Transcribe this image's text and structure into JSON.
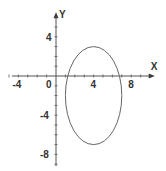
{
  "chart_data": {
    "type": "line",
    "title": "",
    "xlabel": "X",
    "ylabel": "Y",
    "xlim": [
      -5,
      10.5
    ],
    "ylim": [
      -9,
      6.5
    ],
    "x_ticks": [
      -4,
      0,
      4,
      8
    ],
    "x_tick_labels": [
      "-4",
      "0",
      "4",
      "8"
    ],
    "y_ticks": [
      4,
      -4,
      -8
    ],
    "y_tick_labels": [
      "4",
      "-4",
      "-8"
    ],
    "minor_tick_step": 1,
    "grid": false,
    "series": [
      {
        "name": "ellipse",
        "shape": "ellipse",
        "center": [
          4,
          -2
        ],
        "semi_axis_x": 3,
        "semi_axis_y": 5,
        "equation": "(x-4)^2/9 + (y+2)^2/25 = 1",
        "color": "#666666"
      }
    ]
  },
  "layout": {
    "origin_px": [
      56,
      76
    ],
    "px_per_unit_x": 9.4,
    "px_per_unit_y": 9.8
  }
}
